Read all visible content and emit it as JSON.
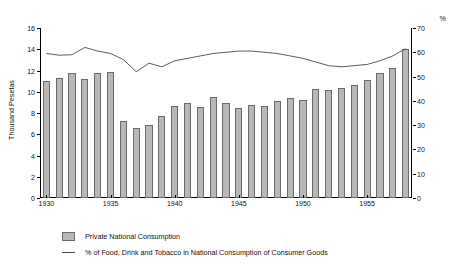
{
  "axes": {
    "y_left_title": "Thousand Pesetas",
    "y_right_title": "%"
  },
  "legend": {
    "bars_label": "Private National Consumption",
    "line_label": "% of Food, Drink and Tobacco in National Consumption of Consumer Goods"
  },
  "chart_data": {
    "type": "bar",
    "title": "",
    "xlabel": "",
    "ylabel": "Thousand Pesetas",
    "y2label": "%",
    "ylim": [
      0,
      16
    ],
    "y2lim": [
      0,
      70
    ],
    "yticks": [
      0,
      2,
      4,
      6,
      8,
      10,
      12,
      14,
      16
    ],
    "y2ticks": [
      0,
      10,
      20,
      30,
      40,
      50,
      60,
      70
    ],
    "xticks": [
      1930,
      1935,
      1940,
      1945,
      1950,
      1955
    ],
    "grid": false,
    "legend_position": "bottom-left",
    "categories": [
      1930,
      1931,
      1932,
      1933,
      1934,
      1935,
      1936,
      1937,
      1938,
      1939,
      1940,
      1941,
      1942,
      1943,
      1944,
      1945,
      1946,
      1947,
      1948,
      1949,
      1950,
      1951,
      1952,
      1953,
      1954,
      1955,
      1956,
      1957,
      1958
    ],
    "series": [
      {
        "name": "Private National Consumption",
        "axis": "left",
        "unit": "Thousand Pesetas",
        "values": [
          11.0,
          11.25,
          11.7,
          11.15,
          11.7,
          11.8,
          7.2,
          6.55,
          6.8,
          7.7,
          8.6,
          8.9,
          8.5,
          9.5,
          8.9,
          8.45,
          8.75,
          8.6,
          9.1,
          9.4,
          9.2,
          10.2,
          10.1,
          10.35,
          10.6,
          11.1,
          11.7,
          12.2,
          14.0
        ]
      },
      {
        "name": "% of Food, Drink and Tobacco in National Consumption of Consumer Goods",
        "axis": "right",
        "unit": "%",
        "values": [
          59.5,
          58.8,
          59.0,
          62.0,
          60.5,
          59.5,
          57.0,
          52.0,
          55.5,
          54.0,
          56.5,
          57.5,
          58.5,
          59.5,
          60.0,
          60.5,
          60.5,
          60.0,
          59.5,
          58.5,
          57.5,
          56.0,
          54.5,
          54.0,
          54.5,
          55.0,
          56.5,
          58.5,
          61.5
        ]
      }
    ]
  }
}
